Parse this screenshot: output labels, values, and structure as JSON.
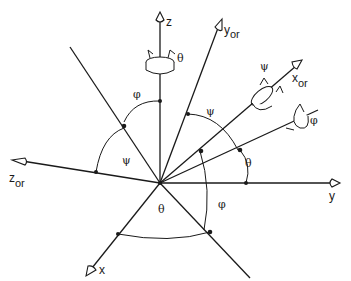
{
  "diagram": {
    "type": "coordinate-frame-rotation",
    "axes": {
      "z": {
        "label": "z",
        "sub": ""
      },
      "y": {
        "label": "y",
        "sub": ""
      },
      "x": {
        "label": "x",
        "sub": ""
      },
      "y_or": {
        "label": "y",
        "sub": "or"
      },
      "x_or": {
        "label": "x",
        "sub": "or"
      },
      "z_or": {
        "label": "z",
        "sub": "or"
      }
    },
    "rotation_labels": {
      "z_axis": "θ",
      "x_or_axis": "ψ",
      "node_line": "φ"
    },
    "angle_labels": {
      "top_left_phi": "φ",
      "left_psi": "ψ",
      "upper_psi": "ψ",
      "right_theta": "θ",
      "bottom_theta": "θ",
      "bottom_right_phi": "φ"
    }
  }
}
